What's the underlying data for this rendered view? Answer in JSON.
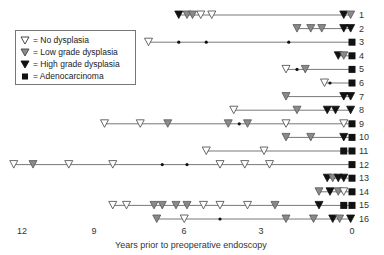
{
  "legend": {
    "items": [
      {
        "symbol": "open-triangle",
        "label": "= No dysplasia"
      },
      {
        "symbol": "gray-triangle",
        "label": "= Low grade dysplasia"
      },
      {
        "symbol": "black-triangle",
        "label": "= High grade dysplasia"
      },
      {
        "symbol": "black-square",
        "label": "= Adenocarcinoma"
      }
    ]
  },
  "axis": {
    "title": "Years prior to preoperative endoscopy",
    "ticks": [
      "12",
      "9",
      "6",
      "3",
      "0"
    ]
  },
  "colors": {
    "no_dysplasia_fill": "#ffffff",
    "low_grade_fill": "#8a8a8a",
    "high_grade_fill": "#111111",
    "adenocarcinoma_fill": "#111111",
    "line": "#555555"
  },
  "chart_data": {
    "type": "scatter",
    "title": "",
    "xlabel": "Years prior to preoperative endoscopy",
    "ylabel": "Patient",
    "xlim": [
      12.5,
      0
    ],
    "x_ticks": [
      12,
      9,
      6,
      3,
      0
    ],
    "grid": false,
    "legend_position": "upper-left",
    "marker_key": {
      "N": "No dysplasia (open triangle)",
      "L": "Low grade dysplasia (gray triangle)",
      "H": "High grade dysplasia (black triangle)",
      "A": "Adenocarcinoma (black square)",
      "d": "Small dot (unlabeled point)"
    },
    "patients": [
      {
        "id": "1",
        "points": [
          [
            6.3,
            "H"
          ],
          [
            6.0,
            "L"
          ],
          [
            5.8,
            "L"
          ],
          [
            5.5,
            "N"
          ],
          [
            5.1,
            "N"
          ],
          [
            0.3,
            "H"
          ],
          [
            0.05,
            "L"
          ]
        ]
      },
      {
        "id": "2",
        "points": [
          [
            2.0,
            "L"
          ],
          [
            1.5,
            "L"
          ],
          [
            1.1,
            "L"
          ],
          [
            0.3,
            "H"
          ],
          [
            0.05,
            "H"
          ]
        ]
      },
      {
        "id": "3",
        "points": [
          [
            7.4,
            "N"
          ],
          [
            6.3,
            "d"
          ],
          [
            5.3,
            "d"
          ],
          [
            2.3,
            "d"
          ],
          [
            0,
            "A"
          ]
        ]
      },
      {
        "id": "4",
        "points": [
          [
            0.5,
            "H"
          ],
          [
            0.3,
            "L"
          ],
          [
            0,
            "A"
          ]
        ]
      },
      {
        "id": "5",
        "points": [
          [
            2.4,
            "N"
          ],
          [
            2.0,
            "d"
          ],
          [
            1.7,
            "L"
          ],
          [
            0,
            "A"
          ]
        ]
      },
      {
        "id": "6",
        "points": [
          [
            1.0,
            "N"
          ],
          [
            0.8,
            "d"
          ],
          [
            0,
            "A"
          ]
        ]
      },
      {
        "id": "7",
        "points": [
          [
            2.4,
            "L"
          ],
          [
            0.3,
            "H"
          ],
          [
            0.05,
            "H"
          ]
        ]
      },
      {
        "id": "8",
        "points": [
          [
            4.3,
            "N"
          ],
          [
            2.0,
            "L"
          ],
          [
            0.9,
            "H"
          ],
          [
            0.6,
            "H"
          ],
          [
            0.05,
            "H"
          ]
        ]
      },
      {
        "id": "9",
        "points": [
          [
            9.0,
            "N"
          ],
          [
            7.7,
            "N"
          ],
          [
            6.7,
            "L"
          ],
          [
            4.5,
            "L"
          ],
          [
            4.1,
            "d"
          ],
          [
            3.8,
            "L"
          ],
          [
            2.4,
            "N"
          ],
          [
            0.3,
            "N"
          ],
          [
            0,
            "A"
          ]
        ]
      },
      {
        "id": "10",
        "points": [
          [
            2.4,
            "L"
          ],
          [
            1.5,
            "L"
          ],
          [
            0.3,
            "H"
          ],
          [
            0,
            "A"
          ]
        ]
      },
      {
        "id": "11",
        "points": [
          [
            5.3,
            "N"
          ],
          [
            3.2,
            "N"
          ],
          [
            0.3,
            "A"
          ],
          [
            0,
            "A"
          ]
        ]
      },
      {
        "id": "12",
        "points": [
          [
            12.3,
            "N"
          ],
          [
            11.6,
            "L"
          ],
          [
            10.3,
            "N"
          ],
          [
            8.7,
            "N"
          ],
          [
            6.9,
            "d"
          ],
          [
            6.0,
            "d"
          ],
          [
            4.8,
            "N"
          ],
          [
            3.9,
            "N"
          ],
          [
            3.0,
            "N"
          ],
          [
            0,
            "A"
          ]
        ]
      },
      {
        "id": "13",
        "points": [
          [
            0.9,
            "H"
          ],
          [
            0.7,
            "L"
          ],
          [
            0.5,
            "H"
          ],
          [
            0.3,
            "H"
          ],
          [
            0,
            "A"
          ]
        ]
      },
      {
        "id": "14",
        "points": [
          [
            1.2,
            "L"
          ],
          [
            0.8,
            "H"
          ],
          [
            0.5,
            "L"
          ],
          [
            0.3,
            "N"
          ],
          [
            0,
            "A"
          ]
        ]
      },
      {
        "id": "15",
        "points": [
          [
            8.7,
            "N"
          ],
          [
            8.2,
            "N"
          ],
          [
            7.2,
            "L"
          ],
          [
            6.9,
            "L"
          ],
          [
            6.4,
            "L"
          ],
          [
            6.0,
            "L"
          ],
          [
            5.4,
            "N"
          ],
          [
            4.8,
            "N"
          ],
          [
            3.8,
            "N"
          ],
          [
            2.8,
            "L"
          ],
          [
            1.2,
            "H"
          ],
          [
            0.3,
            "A"
          ],
          [
            0,
            "A"
          ]
        ]
      },
      {
        "id": "16",
        "points": [
          [
            7.1,
            "L"
          ],
          [
            6.1,
            "N"
          ],
          [
            4.8,
            "d"
          ],
          [
            2.4,
            "L"
          ],
          [
            1.4,
            "L"
          ],
          [
            0.7,
            "H"
          ],
          [
            0.45,
            "L"
          ],
          [
            0.05,
            "H"
          ]
        ]
      }
    ]
  }
}
